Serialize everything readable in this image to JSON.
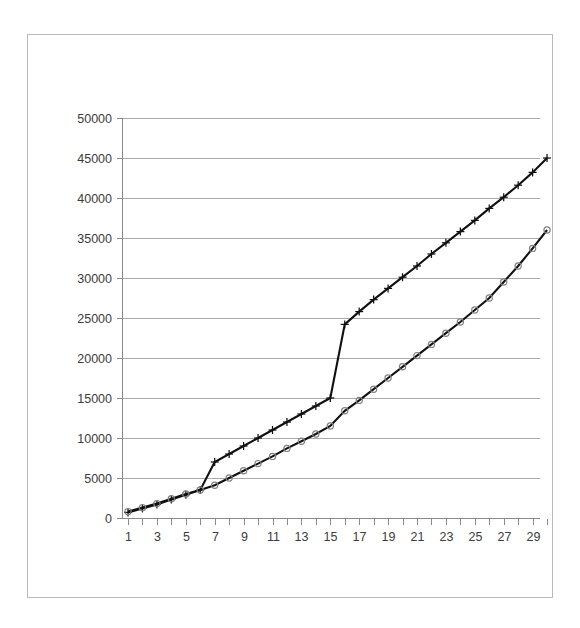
{
  "chart_data": {
    "type": "line",
    "title": "",
    "subtitle": "",
    "xlabel": "",
    "ylabel": "",
    "xlim": [
      1,
      30
    ],
    "ylim": [
      0,
      50000
    ],
    "grid": "horizontal",
    "legend": "none",
    "y_ticks": [
      0,
      5000,
      10000,
      15000,
      20000,
      25000,
      30000,
      35000,
      40000,
      45000,
      50000
    ],
    "y_tick_labels": [
      "0",
      "5000",
      "10000",
      "15000",
      "20000",
      "25000",
      "30000",
      "35000",
      "40000",
      "45000",
      "50000"
    ],
    "x_ticks": [
      1,
      2,
      3,
      4,
      5,
      6,
      7,
      8,
      9,
      10,
      11,
      12,
      13,
      14,
      15,
      16,
      17,
      18,
      19,
      20,
      21,
      22,
      23,
      24,
      25,
      26,
      27,
      28,
      29,
      30
    ],
    "x_tick_labels": [
      "1",
      "",
      "3",
      "",
      "5",
      "",
      "7",
      "",
      "9",
      "",
      "11",
      "",
      "13",
      "",
      "15",
      "",
      "17",
      "",
      "19",
      "",
      "21",
      "",
      "23",
      "",
      "25",
      "",
      "27",
      "",
      "29",
      ""
    ],
    "x": [
      1,
      2,
      3,
      4,
      5,
      6,
      7,
      8,
      9,
      10,
      11,
      12,
      13,
      14,
      15,
      16,
      17,
      18,
      19,
      20,
      21,
      22,
      23,
      24,
      25,
      26,
      27,
      28,
      29,
      30
    ],
    "series": [
      {
        "name": "series-plus",
        "marker": "plus",
        "color": "#111111",
        "values": [
          700,
          1200,
          1700,
          2300,
          2900,
          3500,
          7000,
          8000,
          9000,
          10000,
          11000,
          12000,
          13000,
          14000,
          15000,
          24200,
          25800,
          27300,
          28700,
          30100,
          31500,
          33000,
          34400,
          35800,
          37200,
          38700,
          40100,
          41600,
          43200,
          45000
        ]
      },
      {
        "name": "series-circle",
        "marker": "circle",
        "color": "#111111",
        "values": [
          800,
          1300,
          1800,
          2400,
          3000,
          3500,
          4100,
          5000,
          5900,
          6800,
          7700,
          8700,
          9600,
          10500,
          11500,
          13400,
          14700,
          16100,
          17500,
          18900,
          20300,
          21700,
          23100,
          24500,
          26000,
          27500,
          29500,
          31500,
          33700,
          36000
        ]
      }
    ]
  }
}
